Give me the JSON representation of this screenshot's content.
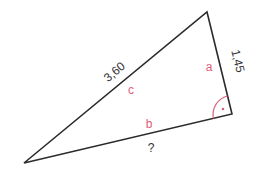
{
  "diagram": {
    "type": "right-triangle",
    "vertices": {
      "top": [
        207,
        12
      ],
      "right_angle": [
        232,
        114
      ],
      "bottom_left": [
        24,
        163
      ]
    },
    "sides": {
      "c": {
        "letter": "c",
        "value": "3,60",
        "role": "hypotenuse"
      },
      "a": {
        "letter": "a",
        "value": "1,45"
      },
      "b": {
        "letter": "b",
        "value": "?"
      }
    },
    "right_angle_marker": "•",
    "colors": {
      "line": "#2b2b2b",
      "letter": "#e0607a",
      "value_text": "#333333"
    }
  }
}
